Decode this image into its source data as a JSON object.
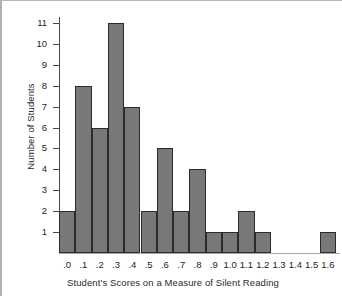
{
  "chart_data": {
    "type": "bar",
    "title": "",
    "xlabel": "Student's Scores on a Measure of Silent Reading",
    "ylabel": "Number of Students",
    "categories": [
      ".0",
      ".1",
      ".2",
      ".3",
      ".4",
      ".5",
      ".6",
      ".7",
      ".8",
      ".9",
      "1.0",
      "1.1",
      "1.2",
      "1.3",
      "1.4",
      "1.5",
      "1.6"
    ],
    "values": [
      2,
      8,
      6,
      11,
      7,
      2,
      5,
      2,
      4,
      1,
      1,
      2,
      1,
      0,
      0,
      0,
      1
    ],
    "ylim": [
      0,
      11
    ],
    "yticks": [
      1,
      2,
      3,
      4,
      5,
      6,
      7,
      8,
      9,
      10,
      11
    ],
    "ytick_labels": [
      "1",
      "2",
      "3",
      "4",
      "5",
      "6",
      "7",
      "8",
      "9",
      "10",
      "11"
    ],
    "grid": false,
    "legend": false,
    "bar_fill_color": "#787878",
    "bar_edge_color": "#2b2b2b",
    "axis_color": "#4a4a4a",
    "background_color": "#ffffff"
  }
}
